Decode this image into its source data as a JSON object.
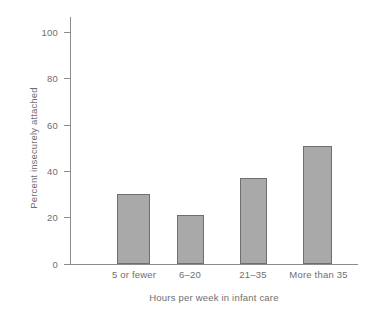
{
  "chart_data": {
    "type": "bar",
    "title": "",
    "subtitle": "",
    "categories": [
      "5 or fewer",
      "6–20",
      "21–35",
      "More than 35"
    ],
    "values": [
      30,
      21,
      37,
      51
    ],
    "series": [
      {
        "name": "Percent insecurely attached",
        "values": [
          30,
          21,
          37,
          51
        ]
      }
    ],
    "xlabel": "Hours per week in infant care",
    "ylabel": "Percent insecurely attached",
    "ylim": [
      0,
      100
    ],
    "yticks": [
      0,
      20,
      40,
      60,
      80,
      100
    ],
    "ytick_labels": [
      "0",
      "20",
      "40",
      "60",
      "80",
      "100"
    ],
    "grid": false,
    "legend": false,
    "legend_position": "none",
    "bar_fill_color": "#a9a9a9",
    "bar_edge_color": "#6f6f6f",
    "axis_color": "#8c8c8c",
    "text_color": "#6e6e6e",
    "background_color": "#ffffff",
    "annotations": []
  }
}
